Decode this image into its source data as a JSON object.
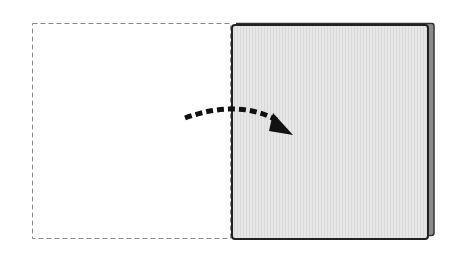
{
  "diagram": {
    "type": "paper-fold-instruction",
    "elements": {
      "original_position_outline": {
        "style": "dashed",
        "color": "#8a8a8a"
      },
      "folded_sheet": {
        "fill": "#e4e4e4",
        "stroke": "#222222",
        "back_layer_color": "#7a7a7a"
      },
      "fold_arrow": {
        "style": "dashed-curved",
        "color": "#111111",
        "direction": "left-to-right"
      }
    }
  },
  "colors": {
    "background": "#ffffff",
    "outline_dashed": "#8a8a8a",
    "sheet_fill": "#e6e6e6",
    "sheet_stroke": "#222222",
    "arrow": "#111111"
  }
}
